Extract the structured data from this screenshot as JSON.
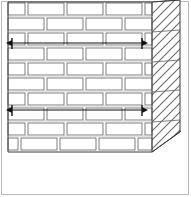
{
  "figure": {
    "name": "brick-wall-perspective-detail",
    "background_color": "#ffffff",
    "frame": {
      "name": "drawing-frame",
      "x": 1,
      "y": 1,
      "width": 188,
      "height": 194,
      "stroke": "#b9b9b9",
      "stroke_width": 1
    },
    "colors": {
      "outline": "#3a3a3a",
      "brick_stroke": "#6f6f6f",
      "mortar_shadow": "#9a9a9a",
      "hatch": "#6a6a6a",
      "annotation": "#111111",
      "frame": "#b9b9b9",
      "fill": "#ffffff"
    },
    "wall_face": {
      "name": "brick-wall-elevation",
      "x": 8,
      "y": 2,
      "width": 144,
      "height": 150,
      "course_height": 15,
      "bond_pattern": "running-bond",
      "brick_length": 36,
      "head_joint": 3,
      "bed_joint": 2
    },
    "courses": [
      {
        "index": 0,
        "y": 2,
        "offset": -18,
        "bricks": 5
      },
      {
        "index": 1,
        "y": 17,
        "offset": 0,
        "bricks": 4
      },
      {
        "index": 2,
        "y": 32,
        "offset": -18,
        "bricks": 5
      },
      {
        "index": 3,
        "y": 47,
        "offset": 0,
        "bricks": 4
      },
      {
        "index": 4,
        "y": 62,
        "offset": -18,
        "bricks": 5
      },
      {
        "index": 5,
        "y": 77,
        "offset": 0,
        "bricks": 4
      },
      {
        "index": 6,
        "y": 92,
        "offset": -18,
        "bricks": 5
      },
      {
        "index": 7,
        "y": 107,
        "offset": 0,
        "bricks": 4
      },
      {
        "index": 8,
        "y": 122,
        "offset": -18,
        "bricks": 5
      },
      {
        "index": 9,
        "y": 137,
        "offset": 0,
        "bricks": 4
      }
    ],
    "side_face": {
      "name": "wall-side-section",
      "top_left_x": 152,
      "top_left_y": 2,
      "depth_x": 28,
      "depth_y": -2,
      "hatch_angle_deg": 60,
      "hatch_spacing": 9,
      "description": "diagonal section hatching on returning wall face"
    },
    "annotations": {
      "dimension_lines": [
        {
          "name": "tie-dimension-upper",
          "y": 43,
          "x_start": 12,
          "x_end": 142,
          "arrow_left": true,
          "arrow_right": true,
          "label": ""
        },
        {
          "name": "tie-dimension-lower",
          "y": 110,
          "x_start": 12,
          "x_end": 142,
          "arrow_left": true,
          "arrow_right": true,
          "label": ""
        }
      ],
      "ground_line": {
        "name": "base-line",
        "x_start": 8,
        "y": 152,
        "x_end": 152
      },
      "perspective_edge": {
        "name": "floor-perspective-edge",
        "x_start": 152,
        "y_start": 152,
        "x_end": 180,
        "y_end": 132
      }
    }
  }
}
